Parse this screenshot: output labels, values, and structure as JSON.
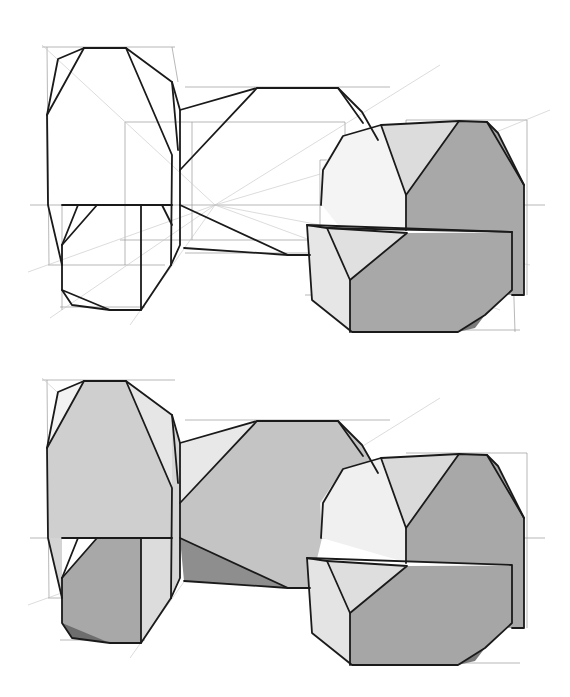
{
  "colors": {
    "background": "#ffffff",
    "ink": "#1a1a1a",
    "guide": "#9a9a9a",
    "light": "#ececec",
    "mid": "#c8c8c8",
    "dark": "#a8a8a8",
    "darkest": "#7a7a7a"
  },
  "drawings": [
    {
      "name": "line-study",
      "offset_y": 0,
      "shaded": false
    },
    {
      "name": "tonal-study",
      "offset_y": 333,
      "shaded": true
    }
  ]
}
